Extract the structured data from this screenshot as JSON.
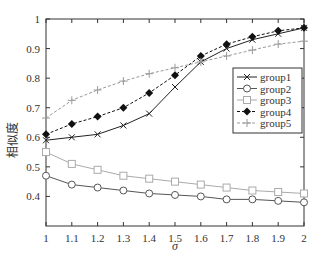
{
  "chart_data": {
    "type": "line",
    "title": "",
    "xlabel": "σ",
    "ylabel": "相似度",
    "x": [
      1,
      1.1,
      1.2,
      1.3,
      1.4,
      1.5,
      1.6,
      1.7,
      1.8,
      1.9,
      2
    ],
    "xticks": [
      "1",
      "1.1",
      "1.2",
      "1.3",
      "1.4",
      "1.5",
      "1.6",
      "1.7",
      "1.8",
      "1.9",
      "2"
    ],
    "yticks": [
      "0.4",
      "0.5",
      "0.6",
      "0.7",
      "0.8",
      "0.9",
      "1"
    ],
    "xlim": [
      1,
      2
    ],
    "ylim": [
      0.3,
      1
    ],
    "grid": false,
    "legend_position": "right-center",
    "series": [
      {
        "name": "group1",
        "style": "solid",
        "color": "#222222",
        "marker": "x",
        "values": [
          0.59,
          0.6,
          0.61,
          0.64,
          0.68,
          0.77,
          0.855,
          0.9,
          0.93,
          0.95,
          0.97
        ]
      },
      {
        "name": "group2",
        "style": "solid",
        "color": "#555555",
        "marker": "circle",
        "values": [
          0.47,
          0.44,
          0.43,
          0.42,
          0.41,
          0.405,
          0.4,
          0.39,
          0.39,
          0.385,
          0.38
        ]
      },
      {
        "name": "group3",
        "style": "solid",
        "color": "#aaaaaa",
        "marker": "square",
        "values": [
          0.55,
          0.51,
          0.49,
          0.47,
          0.46,
          0.45,
          0.44,
          0.43,
          0.42,
          0.415,
          0.41
        ]
      },
      {
        "name": "group4",
        "style": "dashed",
        "color": "#111111",
        "marker": "diamond",
        "values": [
          0.61,
          0.645,
          0.67,
          0.7,
          0.75,
          0.81,
          0.875,
          0.915,
          0.94,
          0.96,
          0.97
        ]
      },
      {
        "name": "group5",
        "style": "dashed",
        "color": "#999999",
        "marker": "plus",
        "values": [
          0.665,
          0.725,
          0.76,
          0.79,
          0.815,
          0.835,
          0.855,
          0.875,
          0.895,
          0.915,
          0.925
        ]
      }
    ]
  }
}
